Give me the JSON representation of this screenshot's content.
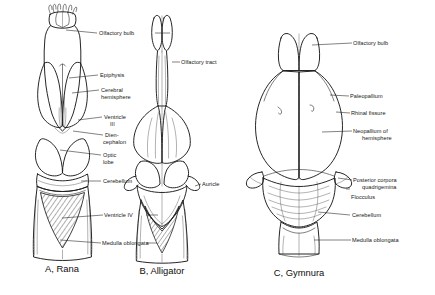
{
  "figure": {
    "background_color": "#ffffff",
    "ink_color": "#1a1a1a"
  },
  "panels": [
    {
      "id": "a",
      "caption": "A, Rana",
      "labels": [
        {
          "text": "Olfactory bulb",
          "side": "right"
        },
        {
          "text": "Epiphysis",
          "side": "right"
        },
        {
          "text": "Cerebral",
          "side": "right"
        },
        {
          "text": "hemisphere",
          "side": "right"
        },
        {
          "text": "Ventricle",
          "side": "right"
        },
        {
          "text": "III",
          "side": "right"
        },
        {
          "text": "Dien-",
          "side": "right"
        },
        {
          "text": "cephalon",
          "side": "right"
        },
        {
          "text": "Optic",
          "side": "right"
        },
        {
          "text": "lobe",
          "side": "right"
        },
        {
          "text": "Cerebellum",
          "side": "right"
        },
        {
          "text": "Ventricle IV",
          "side": "right"
        },
        {
          "text": "Medulla oblongata",
          "side": "right"
        }
      ]
    },
    {
      "id": "b",
      "caption": "B, Alligator",
      "labels": [
        {
          "text": "Olfactory tract",
          "side": "right"
        },
        {
          "text": "Auricle",
          "side": "right"
        }
      ]
    },
    {
      "id": "c",
      "caption": "C, Gymnura",
      "labels": [
        {
          "text": "Olfactory bulb",
          "side": "right"
        },
        {
          "text": "Paleopallium",
          "side": "right"
        },
        {
          "text": "Rhinal fissure",
          "side": "right"
        },
        {
          "text": "Neopallium of",
          "side": "right"
        },
        {
          "text": "hemisphere",
          "side": "right"
        },
        {
          "text": "Posterior corpora",
          "side": "right"
        },
        {
          "text": "quadrigemina",
          "side": "right"
        },
        {
          "text": "Flocculus",
          "side": "right"
        },
        {
          "text": "Cerebellum",
          "side": "right"
        },
        {
          "text": "Medulla oblongata",
          "side": "right"
        }
      ]
    }
  ],
  "annotations": {
    "olfactory_bulb_a": "Olfactory bulb",
    "epiphysis": "Epiphysis",
    "cerebral_hemisphere_l1": "Cerebral",
    "cerebral_hemisphere_l2": "hemisphere",
    "ventricle3_l1": "Ventricle",
    "ventricle3_l2": "III",
    "diencephalon_l1": "Dien-",
    "diencephalon_l2": "cephalon",
    "optic_lobe_l1": "Optic",
    "optic_lobe_l2": "lobe",
    "cerebellum_a": "Cerebellum",
    "ventricle4": "Ventricle IV",
    "medulla_oblongata_a": "Medulla oblongata",
    "olfactory_tract": "Olfactory tract",
    "auricle": "Auricle",
    "olfactory_bulb_c": "Olfactory bulb",
    "paleopallium": "Paleopallium",
    "rhinal_fissure": "Rhinal fissure",
    "neopallium_l1": "Neopallium of",
    "neopallium_l2": "hemisphere",
    "posterior_corpora_l1": "Posterior corpora",
    "posterior_corpora_l2": "quadrigemina",
    "flocculus": "Flocculus",
    "cerebellum_c": "Cerebellum",
    "medulla_oblongata_c": "Medulla oblongata"
  },
  "captions": {
    "a": "A, Rana",
    "b": "B, Alligator",
    "c": "C, Gymnura"
  }
}
